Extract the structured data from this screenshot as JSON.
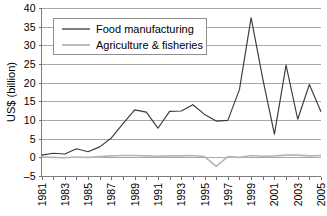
{
  "chart_data": {
    "type": "line",
    "title": "",
    "xlabel": "",
    "ylabel": "US$ (billion)",
    "ylim": [
      -5,
      40
    ],
    "ytick_step": 5,
    "yticks": [
      "40",
      "35",
      "30",
      "25",
      "20",
      "15",
      "10",
      "5",
      "0",
      "–5"
    ],
    "grid": true,
    "legend_position": "top-left",
    "x": [
      1981,
      1982,
      1983,
      1984,
      1985,
      1986,
      1987,
      1988,
      1989,
      1990,
      1991,
      1992,
      1993,
      1994,
      1995,
      1996,
      1997,
      1998,
      1999,
      2000,
      2001,
      2002,
      2003,
      2004,
      2005
    ],
    "xtick_labels": [
      "1981",
      "1983",
      "1985",
      "1987",
      "1989",
      "1991",
      "1993",
      "1995",
      "1997",
      "1999",
      "2001",
      "2003",
      "2005"
    ],
    "series": [
      {
        "name": "Food manufacturing",
        "color": "#3a3a3a",
        "values": [
          0.6,
          1.1,
          0.9,
          2.3,
          1.5,
          2.8,
          5.2,
          9.0,
          12.7,
          12.1,
          7.8,
          12.3,
          12.4,
          14.1,
          11.5,
          9.7,
          9.9,
          18.2,
          37.4,
          21.0,
          6.2,
          24.7,
          10.2,
          19.5,
          12.2
        ]
      },
      {
        "name": "Agriculture & fisheries",
        "color": "#b6b6b6",
        "values": [
          0.1,
          0.0,
          -0.1,
          0.1,
          0.0,
          0.2,
          0.4,
          0.5,
          0.5,
          0.4,
          0.3,
          0.4,
          0.4,
          0.5,
          0.2,
          -2.4,
          0.2,
          0.0,
          0.5,
          0.3,
          0.4,
          0.6,
          0.6,
          0.4,
          0.5
        ]
      }
    ]
  },
  "legend": {
    "items": [
      {
        "label": "Food manufacturing",
        "color": "#3a3a3a"
      },
      {
        "label": "Agriculture & fisheries",
        "color": "#b6b6b6"
      }
    ]
  },
  "axes": {
    "y_title": "US$ (billion)"
  }
}
